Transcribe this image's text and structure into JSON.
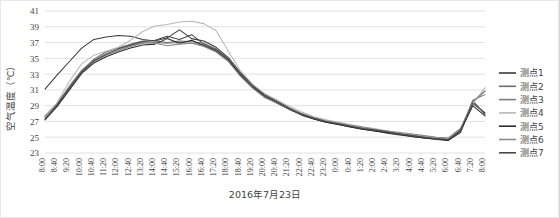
{
  "chart_data": {
    "type": "line",
    "title": "",
    "xlabel": "2016年7月23日",
    "ylabel": "空气温度（℃）",
    "ylim": [
      23,
      41
    ],
    "ytick_step": 2,
    "yticks": [
      23,
      25,
      27,
      29,
      31,
      33,
      35,
      37,
      39,
      41
    ],
    "grid": "horizontal",
    "legend_position": "right",
    "categories": [
      "8:00",
      "8:40",
      "9:20",
      "10:00",
      "10:40",
      "11:20",
      "12:00",
      "12:40",
      "13:20",
      "14:00",
      "14:40",
      "15:20",
      "16:00",
      "16:40",
      "17:20",
      "18:00",
      "18:40",
      "19:20",
      "20:00",
      "20:40",
      "21:20",
      "22:00",
      "22:40",
      "23:20",
      "0:00",
      "0:40",
      "1:20",
      "2:00",
      "2:40",
      "3:20",
      "4:00",
      "4:40",
      "5:20",
      "6:00",
      "6:40",
      "7:20",
      "8:00"
    ],
    "series": [
      {
        "name": "测点1",
        "color": "#3a3a3a",
        "values": [
          31.1,
          32.9,
          34.6,
          36.3,
          37.4,
          37.7,
          37.9,
          37.8,
          37.4,
          37.2,
          37.6,
          38.6,
          37.5,
          37.2,
          36.4,
          35.1,
          33.2,
          31.6,
          30.4,
          29.6,
          28.7,
          27.9,
          27.3,
          26.9,
          26.6,
          26.3,
          26.0,
          25.8,
          25.5,
          25.3,
          25.1,
          24.9,
          24.7,
          24.6,
          25.6,
          29.6,
          27.9
        ]
      },
      {
        "name": "测点2",
        "color": "#6e6e6e",
        "values": [
          27.6,
          29.2,
          31.4,
          33.4,
          34.9,
          35.8,
          36.3,
          36.8,
          37.2,
          37.2,
          37.0,
          37.2,
          37.1,
          36.9,
          36.2,
          34.9,
          33.0,
          31.5,
          30.3,
          29.5,
          28.7,
          28.0,
          27.4,
          27.0,
          26.7,
          26.4,
          26.1,
          25.9,
          25.6,
          25.4,
          25.2,
          25.0,
          24.8,
          24.7,
          25.9,
          29.7,
          30.4
        ]
      },
      {
        "name": "测点3",
        "color": "#7d7d7d",
        "values": [
          27.5,
          29.0,
          31.2,
          33.2,
          34.6,
          35.4,
          36.0,
          36.5,
          36.9,
          37.0,
          36.9,
          37.0,
          36.9,
          36.7,
          36.0,
          34.8,
          32.9,
          31.4,
          30.2,
          29.4,
          28.6,
          27.9,
          27.4,
          27.0,
          26.7,
          26.4,
          26.2,
          25.9,
          25.7,
          25.5,
          25.3,
          25.1,
          24.9,
          24.8,
          26.0,
          29.4,
          30.8
        ]
      },
      {
        "name": "测点4",
        "color": "#b8b8b8",
        "values": [
          27.4,
          29.4,
          32.1,
          34.3,
          35.4,
          35.9,
          36.4,
          37.3,
          38.4,
          39.1,
          39.3,
          39.6,
          39.7,
          39.4,
          38.5,
          35.9,
          33.4,
          31.7,
          30.5,
          29.7,
          28.9,
          28.2,
          27.6,
          27.2,
          26.9,
          26.6,
          26.3,
          26.1,
          25.8,
          25.6,
          25.4,
          25.2,
          25.0,
          24.9,
          26.1,
          29.2,
          31.3
        ]
      },
      {
        "name": "测点5",
        "color": "#2c2c2c",
        "values": [
          27.2,
          28.9,
          31.0,
          33.1,
          34.4,
          35.2,
          35.8,
          36.3,
          36.7,
          36.8,
          37.5,
          36.9,
          37.3,
          36.6,
          35.9,
          34.7,
          32.8,
          31.3,
          30.1,
          29.3,
          28.5,
          27.8,
          27.3,
          26.9,
          26.6,
          26.3,
          26.0,
          25.8,
          25.6,
          25.4,
          25.1,
          24.9,
          24.8,
          24.6,
          25.8,
          29.0,
          27.7
        ]
      },
      {
        "name": "测点6",
        "color": "#8c8c8c",
        "values": [
          27.7,
          29.3,
          31.5,
          33.5,
          34.8,
          35.6,
          36.1,
          36.6,
          37.0,
          36.9,
          36.6,
          36.8,
          36.9,
          36.5,
          35.8,
          34.6,
          32.7,
          31.2,
          30.0,
          29.3,
          28.6,
          28.0,
          27.5,
          27.1,
          26.8,
          26.5,
          26.3,
          26.0,
          25.8,
          25.6,
          25.4,
          25.2,
          25.0,
          24.9,
          26.1,
          29.5,
          30.9
        ]
      },
      {
        "name": "测点7",
        "color": "#4a4a4a",
        "values": [
          27.3,
          29.1,
          31.3,
          33.3,
          34.7,
          35.5,
          36.2,
          36.7,
          37.1,
          37.3,
          37.8,
          37.4,
          38.0,
          36.8,
          36.1,
          34.9,
          33.0,
          31.5,
          30.3,
          29.4,
          28.6,
          27.9,
          27.4,
          27.0,
          26.7,
          26.4,
          26.1,
          25.9,
          25.7,
          25.4,
          25.2,
          25.0,
          24.8,
          24.7,
          25.9,
          29.3,
          28.1
        ]
      }
    ]
  }
}
